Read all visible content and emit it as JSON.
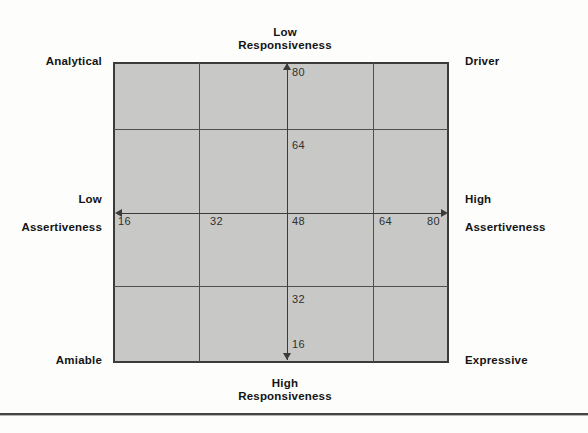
{
  "figure": {
    "title_implied": "Social styles matrix",
    "quadrants": {
      "top_left": "Analytical",
      "top_right": "Driver",
      "bottom_left": "Amiable",
      "bottom_right": "Expressive"
    },
    "axes": {
      "top": {
        "line1": "Low",
        "line2": "Responsiveness"
      },
      "bottom": {
        "line1": "High",
        "line2": "Responsiveness"
      },
      "left": {
        "line1": "Low",
        "line2": "Assertiveness"
      },
      "right": {
        "line1": "High",
        "line2": "Assertiveness"
      }
    },
    "scales": {
      "horizontal_left_to_right": [
        "16",
        "32",
        "48",
        "64",
        "80"
      ],
      "vertical_top_to_bottom": [
        "80",
        "64",
        "32",
        "16"
      ]
    },
    "colors": {
      "grid_fill": "#c8c9c7",
      "grid_border": "#3b3b3b",
      "inner_line": "#4f4f4f",
      "text": "#141414",
      "background": "#fdfdfc"
    }
  }
}
